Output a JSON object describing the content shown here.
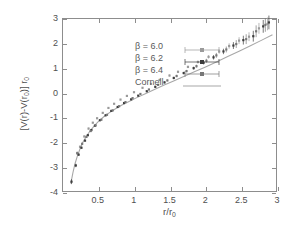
{
  "figure": {
    "background_color": "#ffffff",
    "frame_color": "#8d8d8d"
  },
  "axes": {
    "x": {
      "label_parts": {
        "pre": "r/r",
        "sub": "0"
      },
      "label_text": "r/r0",
      "min": 0,
      "max": 3,
      "ticks": [
        0.5,
        1,
        1.5,
        2,
        2.5,
        3
      ],
      "tick_labels": [
        "0.5",
        "1",
        "1.5",
        "2",
        "2.5",
        "3"
      ]
    },
    "y": {
      "label_parts": {
        "pre": "[V(r)-V(r",
        "sub1": "0",
        "mid": ")] r",
        "sub2": "0"
      },
      "label_text": "[V(r)-V(r0)] r0",
      "min": -4,
      "max": 3,
      "ticks": [
        -4,
        -3,
        -2,
        -1,
        0,
        1,
        2,
        3
      ],
      "tick_labels": [
        "-4",
        "-3",
        "-2",
        "-1",
        "0",
        "1",
        "2",
        "3"
      ]
    }
  },
  "legend": {
    "position": "top-left-inside",
    "entries": [
      {
        "label": "β = 6.0",
        "marker": "square",
        "color": "#9a9a9a",
        "has_errorbar": true
      },
      {
        "label": "β = 6.2",
        "marker": "square",
        "color": "#3c3c3c",
        "has_errorbar": true
      },
      {
        "label": "β = 6.4",
        "marker": "square",
        "color": "#777777",
        "has_errorbar": true
      },
      {
        "label": "Cornell",
        "marker": "line",
        "color": "#a8a8a8",
        "has_errorbar": false
      }
    ]
  },
  "chart_data": {
    "type": "scatter",
    "title": "",
    "xlabel": "r/r0",
    "ylabel": "[V(r)-V(r0)] r0",
    "xlim": [
      0,
      3
    ],
    "ylim": [
      -4,
      3
    ],
    "grid": false,
    "legend_position": "top-left-inside",
    "series": [
      {
        "name": "β = 6.0",
        "color": "#9a9a9a",
        "marker": "square",
        "x": [
          0.24,
          0.3,
          0.36,
          0.42,
          0.48,
          0.56,
          0.64,
          0.72,
          0.81,
          0.9,
          1.0,
          1.12,
          1.24,
          1.36,
          1.5,
          1.62,
          1.76,
          1.9,
          2.05,
          2.2,
          2.34,
          2.48,
          2.62,
          2.76,
          2.88
        ],
        "y": [
          -2.2,
          -1.78,
          -1.46,
          -1.22,
          -1.04,
          -0.82,
          -0.62,
          -0.45,
          -0.28,
          -0.13,
          0.02,
          0.2,
          0.36,
          0.52,
          0.7,
          0.85,
          1.05,
          1.25,
          1.46,
          1.68,
          1.9,
          2.12,
          2.28,
          2.62,
          2.8
        ],
        "yerr": [
          0.05,
          0.04,
          0.04,
          0.03,
          0.03,
          0.03,
          0.03,
          0.03,
          0.03,
          0.03,
          0.03,
          0.03,
          0.03,
          0.04,
          0.04,
          0.05,
          0.05,
          0.06,
          0.07,
          0.09,
          0.11,
          0.14,
          0.18,
          0.22,
          0.26
        ]
      },
      {
        "name": "β = 6.2",
        "color": "#3c3c3c",
        "marker": "square",
        "x": [
          0.12,
          0.18,
          0.22,
          0.26,
          0.31,
          0.35,
          0.4,
          0.45,
          0.52,
          0.6,
          0.68,
          0.77,
          0.86,
          0.96,
          1.06,
          1.18,
          1.3,
          1.43,
          1.56,
          1.7,
          1.84,
          1.98,
          2.12,
          2.26,
          2.4,
          2.54,
          2.68,
          2.82,
          2.9
        ],
        "y": [
          -3.62,
          -2.96,
          -2.52,
          -2.24,
          -1.95,
          -1.73,
          -1.52,
          -1.34,
          -1.12,
          -0.92,
          -0.74,
          -0.58,
          -0.42,
          -0.27,
          -0.12,
          0.06,
          0.24,
          0.42,
          0.6,
          0.8,
          1.0,
          1.22,
          1.44,
          1.68,
          1.92,
          2.14,
          2.3,
          2.7,
          2.86
        ],
        "yerr": [
          0.1,
          0.07,
          0.05,
          0.04,
          0.04,
          0.03,
          0.03,
          0.03,
          0.03,
          0.03,
          0.03,
          0.03,
          0.03,
          0.03,
          0.03,
          0.03,
          0.04,
          0.04,
          0.05,
          0.05,
          0.06,
          0.07,
          0.09,
          0.11,
          0.14,
          0.18,
          0.22,
          0.26,
          0.28
        ]
      },
      {
        "name": "β = 6.4",
        "color": "#777777",
        "marker": "square",
        "x": [
          0.2,
          0.27,
          0.33,
          0.39,
          0.46,
          0.54,
          0.62,
          0.7,
          0.79,
          0.88,
          0.98,
          1.09,
          1.21,
          1.34,
          1.47,
          1.6,
          1.74,
          1.88,
          2.02,
          2.16,
          2.3,
          2.44,
          2.58,
          2.72,
          2.85
        ],
        "y": [
          -2.46,
          -2.08,
          -1.8,
          -1.56,
          -1.33,
          -1.1,
          -0.9,
          -0.72,
          -0.55,
          -0.38,
          -0.22,
          -0.05,
          0.13,
          0.32,
          0.5,
          0.68,
          0.88,
          1.08,
          1.3,
          1.52,
          1.76,
          1.98,
          2.18,
          2.5,
          2.76
        ],
        "yerr": [
          0.07,
          0.05,
          0.04,
          0.04,
          0.03,
          0.03,
          0.03,
          0.03,
          0.03,
          0.03,
          0.03,
          0.03,
          0.03,
          0.04,
          0.04,
          0.05,
          0.05,
          0.06,
          0.08,
          0.1,
          0.12,
          0.16,
          0.2,
          0.24,
          0.28
        ]
      }
    ],
    "fit_curve": {
      "name": "Cornell",
      "color": "#a8a8a8",
      "formula_note": "Cornell potential fit",
      "x": [
        0.11,
        0.14,
        0.17,
        0.2,
        0.24,
        0.28,
        0.33,
        0.38,
        0.44,
        0.5,
        0.57,
        0.65,
        0.74,
        0.83,
        0.93,
        1.04,
        1.16,
        1.28,
        1.41,
        1.55,
        1.7,
        1.85,
        2.0,
        2.16,
        2.32,
        2.48,
        2.64,
        2.8,
        2.95
      ],
      "y": [
        -3.7,
        -3.25,
        -2.88,
        -2.6,
        -2.28,
        -2.02,
        -1.77,
        -1.56,
        -1.35,
        -1.17,
        -0.99,
        -0.82,
        -0.65,
        -0.5,
        -0.36,
        -0.2,
        -0.04,
        0.12,
        0.29,
        0.47,
        0.66,
        0.85,
        1.04,
        1.25,
        1.47,
        1.69,
        1.91,
        2.14,
        2.36
      ]
    }
  }
}
